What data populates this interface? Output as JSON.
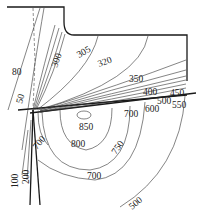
{
  "diagram": {
    "units": "°C",
    "colors": {
      "background": "#ffffff",
      "line": "#1a1a1a"
    },
    "isotherm_labels": {
      "l80": "80",
      "l50": "50",
      "l300": "300",
      "l305": "305",
      "l320": "320",
      "l350": "350",
      "l400": "400",
      "l450": "450",
      "l500a": "500",
      "l550": "550",
      "l600": "600",
      "l700a": "700",
      "l850": "850",
      "l800": "800",
      "l700b": "700",
      "l750": "750",
      "l700c": "700",
      "l100": "100",
      "l200": "200",
      "l500b": "500"
    }
  }
}
